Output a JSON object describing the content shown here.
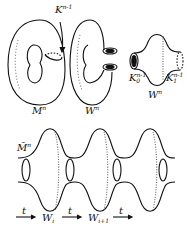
{
  "labels": {
    "M": "M",
    "M_sup": "n",
    "W1": "W",
    "W1_sup": "n",
    "K": "K",
    "K_sup": "n-1",
    "K0": "K",
    "K0_sub": "0",
    "K0_sup": "n-1",
    "K1": "K",
    "K1_sub": "1",
    "K1_sup": "n-1",
    "W2": "W",
    "W2_sup": "n",
    "Mtilde": "M̃",
    "Mtilde_sup": "n",
    "t1": "t",
    "t2": "t",
    "t3": "t",
    "Wi": "W",
    "Wi_sub": "i",
    "Wi1": "W",
    "Wi1_sub": "i+1"
  }
}
